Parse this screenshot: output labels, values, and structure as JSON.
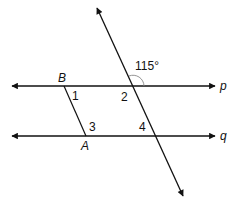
{
  "diagram": {
    "lines": {
      "p": {
        "label": "p"
      },
      "q": {
        "label": "q"
      }
    },
    "points": {
      "B": {
        "label": "B"
      },
      "A": {
        "label": "A"
      }
    },
    "angles": {
      "given": {
        "label": "115°"
      },
      "a1": {
        "label": "1"
      },
      "a2": {
        "label": "2"
      },
      "a3": {
        "label": "3"
      },
      "a4": {
        "label": "4"
      }
    },
    "colors": {
      "stroke": "#111111",
      "arc": "#888888"
    }
  }
}
